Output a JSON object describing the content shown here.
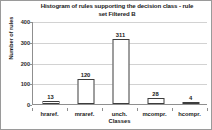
{
  "chart_data": {
    "type": "bar",
    "title": "Histogram of rules supporting the decision class - rule set Filtered B",
    "title_line1": "Histogram of rules supporting the decision class - rule",
    "title_line2": "set Filtered B",
    "xlabel": "Classes",
    "ylabel": "Number of rules",
    "categories": [
      "hraref.",
      "mraref.",
      "unch.",
      "mcompr.",
      "hcompr."
    ],
    "values": [
      13,
      120,
      311,
      28,
      4
    ],
    "value_labels": [
      "13",
      "120",
      "311",
      "28",
      "4"
    ],
    "ylim": [
      0,
      400
    ],
    "yticks": [
      0,
      100,
      200,
      300,
      400
    ],
    "ytick_labels": [
      "0",
      "100",
      "200",
      "300",
      "400"
    ],
    "grid": true,
    "legend": false,
    "bar_fill_color": "#ffffff",
    "bar_border_color": "#3d3d3d",
    "gridline_color": "#d2d2d2",
    "axis_color": "#8f8f8f",
    "text_color": "#1a1a1a"
  }
}
